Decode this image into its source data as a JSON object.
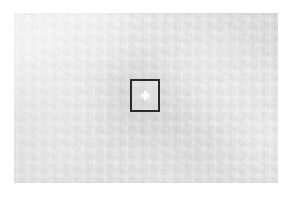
{
  "view": {
    "kind": "magnified-surface-view",
    "canvas_width": 292,
    "canvas_height": 198,
    "page_background_color": "#ffffff"
  },
  "surface": {
    "label": "",
    "description": "",
    "base_color": "#dcdcdc",
    "texture": "mottled-light-gray",
    "left": 14,
    "top": 13,
    "width": 264,
    "height": 170
  },
  "selection": {
    "label": "",
    "border_color": "#2a2a2a",
    "border_width_px": 2,
    "fill_color": "rgba(255,255,255,0.16)",
    "left": 130,
    "top": 79,
    "width": 30,
    "height": 33
  },
  "crosshair": {
    "icon": "plus-crosshair-icon",
    "color": "#fdfdfd",
    "center_x": 145,
    "center_y": 95,
    "size_px": 9,
    "arm_thickness_px": 3
  }
}
